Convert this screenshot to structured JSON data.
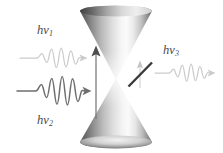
{
  "figure": {
    "kind": "dirac-cone-photon-diagram",
    "background_color": "#ffffff",
    "width": 223,
    "height": 153
  },
  "labels": {
    "incoming_upper": {
      "h": "h",
      "nu": "ν",
      "sub": "1",
      "text": "hν₁"
    },
    "incoming_lower": {
      "h": "h",
      "nu": "ν",
      "sub": "2",
      "text": "hν₂"
    },
    "outgoing_right": {
      "h": "h",
      "nu": "ν",
      "sub": "3",
      "text": "hν₃"
    }
  },
  "cones": {
    "upper": {
      "name": "conduction-band-cone",
      "orientation": "apex-down",
      "apex": {
        "x": 116,
        "y": 79
      },
      "rim_y": 11,
      "rim_half_width": 36,
      "rim_half_height": 5.5,
      "edge_color": "#555555",
      "center_color": "#f4f4f4"
    },
    "lower": {
      "name": "valence-band-cone",
      "orientation": "apex-up",
      "apex": {
        "x": 116,
        "y": 79
      },
      "rim_y": 142,
      "rim_half_width": 36,
      "rim_half_height": 6.5,
      "edge_color": "#5a5a5a",
      "center_color": "#f0f0f0"
    }
  },
  "arrows": {
    "allowed_transition": {
      "name": "allowed-transition-arrow",
      "x": 96,
      "y_tail": 119,
      "y_head": 47,
      "color": "#6d6d6d",
      "head_color": "#4e4e4e",
      "state": "allowed"
    },
    "forbidden_transition": {
      "name": "forbidden-transition-arrow",
      "x": 140,
      "y_tail": 88,
      "y_head": 61,
      "color": "#cfcfcf",
      "state": "forbidden",
      "slash": {
        "x1": 128,
        "y1": 86,
        "x2": 152,
        "y2": 62,
        "color": "#3a3a3a",
        "width": 2.4
      }
    }
  },
  "wave_packets": [
    {
      "name": "incoming-photon-wave-upper",
      "direction": "right",
      "color": "#cccccc",
      "baseline_y": 58,
      "x_start": 20,
      "x_end": 86,
      "amplitude": 11,
      "cycles": 4.5,
      "stroke_width": 1.2,
      "flat_lead": 17,
      "label": "hν₁"
    },
    {
      "name": "incoming-photon-wave-lower",
      "direction": "right",
      "color": "#6f6f6f",
      "baseline_y": 91,
      "x_start": 17,
      "x_end": 90,
      "amplitude": 15,
      "cycles": 4.5,
      "stroke_width": 1.45,
      "flat_lead": 19,
      "label": "hν₂"
    },
    {
      "name": "outgoing-photon-wave-right",
      "direction": "right",
      "color": "#cccccc",
      "baseline_y": 73,
      "x_start": 155,
      "x_end": 216,
      "amplitude": 10,
      "cycles": 4.5,
      "stroke_width": 1.2,
      "flat_lead": 14,
      "label": "hν₃"
    }
  ],
  "colors": {
    "background": "#ffffff",
    "label_text": "#4a4a4a",
    "cone_dark": "#555555",
    "cone_light": "#f4f4f4",
    "wave_light": "#cccccc",
    "wave_dark": "#6f6f6f",
    "slash_dark": "#3a3a3a"
  }
}
